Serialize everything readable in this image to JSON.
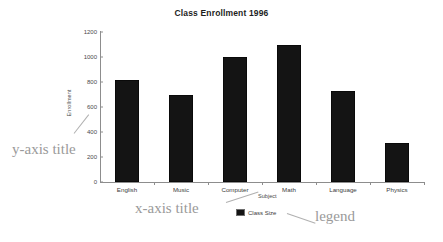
{
  "chart_data": {
    "type": "bar",
    "title": "Class Enrollment 1996",
    "xlabel": "Subject",
    "ylabel": "Enrollment",
    "categories": [
      "English",
      "Music",
      "Computer",
      "Math",
      "Language",
      "Physics"
    ],
    "values": [
      820,
      700,
      1000,
      1100,
      730,
      310
    ],
    "series": [
      {
        "name": "Class Size",
        "values": [
          820,
          700,
          1000,
          1100,
          730,
          310
        ]
      }
    ],
    "ylim": [
      0,
      1200
    ],
    "yticks": [
      "0",
      "200",
      "400",
      "600",
      "800",
      "1000",
      "1200"
    ],
    "ytick_values": [
      0,
      200,
      400,
      600,
      800,
      1000,
      1200
    ],
    "grid": false,
    "legend": {
      "position": "bottom",
      "entries": [
        "Class Size"
      ]
    },
    "bar_color": "#141414",
    "axis_color": "#8d8d8d"
  },
  "annotations": [
    {
      "id": "y-axis-title",
      "text": "y-axis title"
    },
    {
      "id": "x-axis-title",
      "text": "x-axis title"
    },
    {
      "id": "legend",
      "text": "legend"
    }
  ],
  "annotation_color": "#9a9a9a"
}
